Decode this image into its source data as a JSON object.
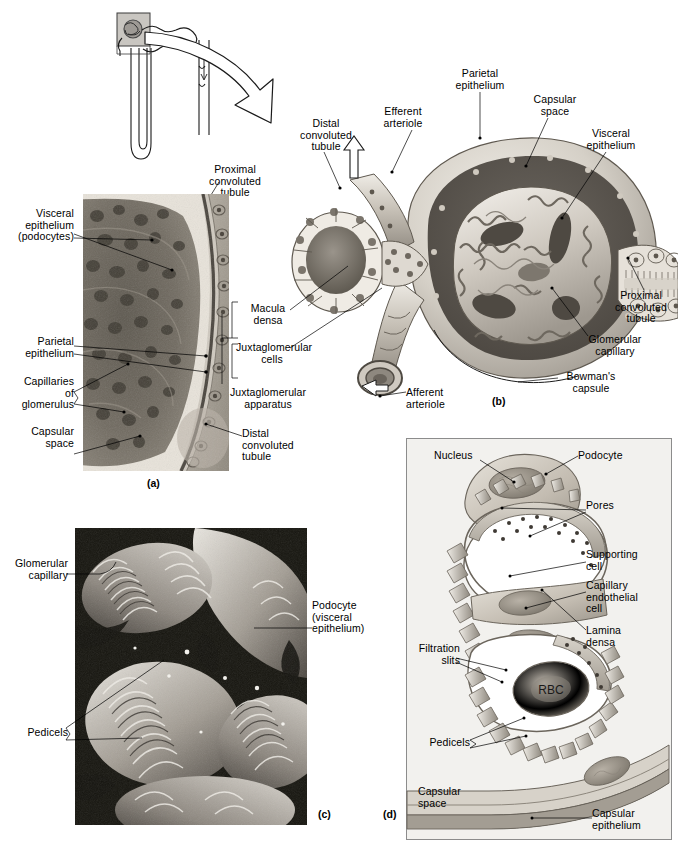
{
  "figure": {
    "panels": [
      "(a)",
      "(b)",
      "(c)",
      "(d)"
    ]
  },
  "overview": {
    "name": "nephron-schematic",
    "labels": [
      {
        "id": "proximal-convoluted-tubule",
        "text": "Proximal\nconvoluted\ntubule"
      }
    ]
  },
  "panel_a": {
    "id": "(a)",
    "caption": "Light micrograph of a renal corpuscle",
    "labels": [
      {
        "id": "visceral-epithelium-podocytes",
        "text": "Visceral\nepithelium\n(podocytes)"
      },
      {
        "id": "parietal-epithelium",
        "text": "Parietal\nepithelium"
      },
      {
        "id": "capillaries-of-glomerulus",
        "text": "Capillaries\nof\nglomerulus"
      },
      {
        "id": "capsular-space",
        "text": "Capsular\nspace"
      },
      {
        "id": "distal-convoluted-tubule",
        "text": "Distal\nconvoluted\ntubule"
      },
      {
        "id": "macula-densa",
        "text": "Macula\ndensa"
      },
      {
        "id": "juxtaglomerular-cells",
        "text": "Juxtaglomerular\ncells"
      },
      {
        "id": "juxtaglomerular-apparatus",
        "text": "Juxtaglomerular\napparatus"
      }
    ]
  },
  "panel_b": {
    "id": "(b)",
    "caption": "Diagrammatic view of the renal corpuscle",
    "labels": [
      {
        "id": "distal-convoluted-tubule",
        "text": "Distal\nconvoluted\ntubule"
      },
      {
        "id": "efferent-arteriole",
        "text": "Efferent\narteriole"
      },
      {
        "id": "parietal-epithelium",
        "text": "Parietal\nepithelium"
      },
      {
        "id": "capsular-space",
        "text": "Capsular\nspace"
      },
      {
        "id": "visceral-epithelium",
        "text": "Visceral\nepithelium"
      },
      {
        "id": "proximal-convoluted-tubule",
        "text": "Proximal\nconvoluted\ntubule"
      },
      {
        "id": "glomerular-capillary",
        "text": "Glomerular\ncapillary"
      },
      {
        "id": "bowmans-capsule",
        "text": "Bowman's\ncapsule"
      },
      {
        "id": "afferent-arteriole",
        "text": "Afferent\narteriole"
      },
      {
        "id": "macula-densa",
        "text": "Macula\ndensa"
      },
      {
        "id": "juxtaglomerular-cells",
        "text": "Juxtaglomerular\ncells"
      },
      {
        "id": "juxtaglomerular-apparatus",
        "text": "Juxtaglomerular\napparatus"
      }
    ]
  },
  "panel_c": {
    "id": "(c)",
    "caption": "Scanning electron micrograph of podocytes",
    "labels": [
      {
        "id": "glomerular-capillary",
        "text": "Glomerular\ncapillary"
      },
      {
        "id": "podocyte-visceral-epithelium",
        "text": "Podocyte\n(visceral\nepithelium)"
      },
      {
        "id": "pedicels",
        "text": "Pedicels"
      }
    ]
  },
  "panel_d": {
    "id": "(d)",
    "caption": "Structure of the filtration membrane",
    "labels": [
      {
        "id": "nucleus",
        "text": "Nucleus"
      },
      {
        "id": "podocyte",
        "text": "Podocyte"
      },
      {
        "id": "pores",
        "text": "Pores"
      },
      {
        "id": "supporting-cell",
        "text": "Supporting\ncell"
      },
      {
        "id": "capillary-endothelial-cell",
        "text": "Capillary\nendothelial\ncell"
      },
      {
        "id": "lamina-densa",
        "text": "Lamina\ndensa"
      },
      {
        "id": "filtration-slits",
        "text": "Filtration\nslits"
      },
      {
        "id": "rbc",
        "text": "RBC"
      },
      {
        "id": "pedicels",
        "text": "Pedicels"
      },
      {
        "id": "capsular-space",
        "text": "Capsular\nspace"
      },
      {
        "id": "capsular-epithelium",
        "text": "Capsular\nepithelium"
      }
    ]
  },
  "colors": {
    "ink": "#000000",
    "panel_bg": "#f2f1ee",
    "panel_border": "#8c8c8c",
    "tissue_light": "#d8d4cd",
    "tissue_mid": "#a9a49c",
    "tissue_dark": "#6f6a63",
    "cavity_dark": "#55504a",
    "white": "#ffffff"
  }
}
